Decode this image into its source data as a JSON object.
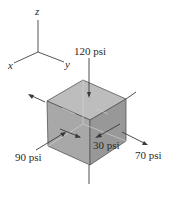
{
  "figure": {
    "type": "stress element (3D cube)",
    "axes": {
      "z": "z",
      "x": "x",
      "y": "y"
    },
    "stresses": [
      {
        "id": "top",
        "label": "120 psi",
        "direction": "compressive, acting on z face"
      },
      {
        "id": "front",
        "label": "90 psi",
        "direction": "compressive, acting on x face"
      },
      {
        "id": "right-inner",
        "label": "30 psi",
        "direction": "shear/compressive on y face"
      },
      {
        "id": "right-outer",
        "label": "70 psi",
        "direction": "tensile, acting on y face"
      }
    ],
    "colors": {
      "top_face": "#bdbdbd",
      "front_face": "#a8a8a8",
      "right_face": "#999999",
      "edge": "#555555",
      "line": "#444444"
    }
  }
}
